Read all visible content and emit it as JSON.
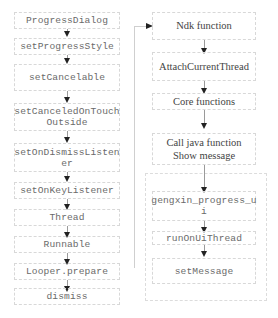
{
  "diagram": {
    "left_column": {
      "nodes": [
        {
          "label": "ProgressDialog"
        },
        {
          "label": "setProgressStyle"
        },
        {
          "label": "setCancelable"
        },
        {
          "label": "setCanceledOnTouch\nOutside"
        },
        {
          "label": "setOnDismissListen\ner"
        },
        {
          "label": "setOnKeyListener"
        },
        {
          "label": "Thread"
        },
        {
          "label": "Runnable"
        },
        {
          "label": "Looper.prepare"
        },
        {
          "label": "dismiss"
        }
      ]
    },
    "right_column": {
      "nodes": [
        {
          "label": "Ndk function"
        },
        {
          "label": "AttachCurrentThread"
        },
        {
          "label": "Core functions"
        },
        {
          "label": "Call java function\nShow message"
        }
      ],
      "sub_group": {
        "nodes": [
          {
            "label": "gengxin_progress_u\ni"
          },
          {
            "label": "runOnUiThread"
          },
          {
            "label": "setMessage"
          }
        ]
      }
    },
    "connector": {
      "from": "Runnable",
      "to": "Ndk function",
      "direction": "left-to-right"
    },
    "colors": {
      "box_border": "#d8d8d8",
      "text": "#6a6a6a",
      "arrow_head": "#222222"
    }
  }
}
